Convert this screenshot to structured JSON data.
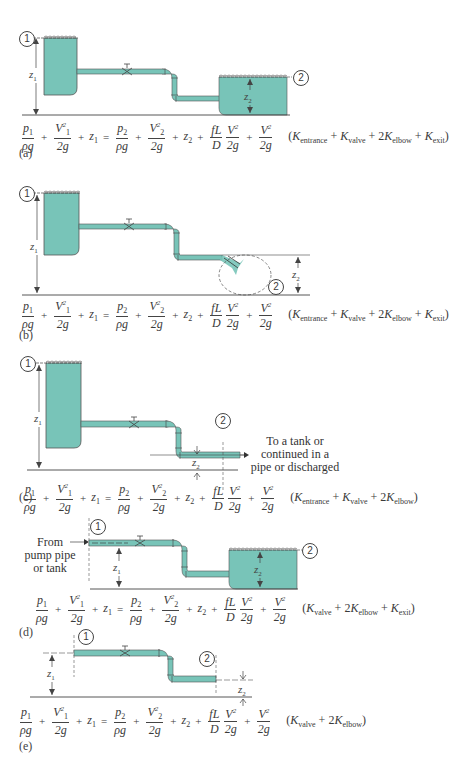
{
  "figure": {
    "colors": {
      "water": "#78c4b8",
      "outline": "#4a4a4a",
      "background": "#ffffff"
    },
    "common_equation": {
      "lhs": [
        "p1/ρg",
        "V1²/2g",
        "z1"
      ],
      "rhs": [
        "p2/ρg",
        "V2²/2g",
        "z2",
        "fL/D · V²/2g",
        "V²/2g"
      ]
    },
    "panels": [
      {
        "id": "a",
        "label": "(a)",
        "description": "Tank 1 to tank 2 through pipe with valve and two elbows",
        "point1": "1",
        "point2": "2",
        "z1_label": "z1",
        "z2_label": "z2",
        "k_terms": "(K_entrance + K_valve + 2K_elbow + K_exit)"
      },
      {
        "id": "b",
        "label": "(b)",
        "description": "Tank 1 discharging to free jet at point 2",
        "point1": "1",
        "point2": "2",
        "z1_label": "z1",
        "z2_label": "z2",
        "k_terms": "(K_entrance + K_valve + 2K_elbow + K_exit)"
      },
      {
        "id": "c",
        "label": "(c)",
        "description": "Tank 1 to section 2 of pipe",
        "point1": "1",
        "point2": "2",
        "z1_label": "z1",
        "z2_label": "z2",
        "note": [
          "To a tank or",
          "continued in a",
          "pipe or discharged"
        ],
        "k_terms": "(K_entrance + K_valve + 2K_elbow)"
      },
      {
        "id": "d",
        "label": "(d)",
        "description": "From pump pipe or tank to tank 2",
        "point1": "1",
        "point2": "2",
        "z1_label": "z1",
        "z2_label": "z2",
        "note": [
          "From",
          "pump pipe",
          "or tank"
        ],
        "k_terms": "(K_valve + 2K_elbow + K_exit)"
      },
      {
        "id": "e",
        "label": "(e)",
        "description": "Pipe section 1 to pipe section 2",
        "point1": "1",
        "point2": "2",
        "z1_label": "z1",
        "z2_label": "z2",
        "k_terms": "(K_valve + 2K_elbow)"
      }
    ]
  },
  "text": {
    "p1": "p",
    "p1_sub": "1",
    "rho_g": "ρg",
    "V1": "V",
    "V1_sub": "1",
    "sq": "2",
    "two_g": "2g",
    "z": "z",
    "sub1": "1",
    "sub2": "2",
    "plus": "+",
    "equals": "=",
    "fL": "fL",
    "D": "D",
    "V": "V",
    "K": "K",
    "entrance": "entrance",
    "valve": "valve",
    "elbow": "elbow",
    "exit": "exit",
    "open": "(",
    "close": ")",
    "two": "2",
    "a": "(a)",
    "b": "(b)",
    "c": "(c)",
    "d": "(d)",
    "e": "(e)",
    "c_note1": "To a tank or",
    "c_note2": "continued in a",
    "c_note3": "pipe or discharged",
    "d_note1": "From",
    "d_note2": "pump pipe",
    "d_note3": "or tank",
    "one": "1",
    "two_c": "2"
  }
}
